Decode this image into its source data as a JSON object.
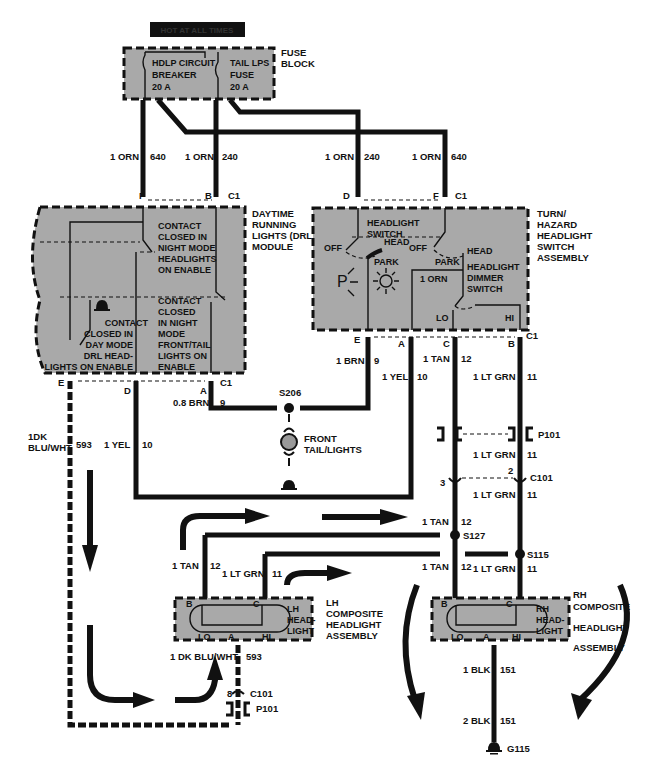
{
  "header_label": "HOT AT ALL TIMES",
  "fuse_block": {
    "title": [
      "FUSE",
      "BLOCK"
    ],
    "circuit_breaker": [
      "HDLP CIRCUIT",
      "BREAKER",
      "20 A"
    ],
    "tail_fuse": [
      "TAIL LPS",
      "FUSE",
      "20 A"
    ]
  },
  "wires_top": [
    {
      "gauge": "1 ORN",
      "circuit": "640"
    },
    {
      "gauge": "1 ORN",
      "circuit": "240"
    },
    {
      "gauge": "1 ORN",
      "circuit": "240"
    },
    {
      "gauge": "1 ORN",
      "circuit": "640"
    }
  ],
  "drl_module": {
    "title": [
      "DAYTIME",
      "RUNNING",
      "LIGHTS (DRL)",
      "MODULE"
    ],
    "contact1": [
      "CONTACT",
      "CLOSED IN",
      "NIGHT MODE",
      "HEADLIGHTS",
      "ON ENABLE"
    ],
    "contact2": [
      "CONTACT",
      "CLOSED",
      "IN NIGHT",
      "MODE",
      "FRONT/TAIL",
      "LIGHTS ON",
      "ENABLE"
    ],
    "contact3": [
      "CONTACT",
      "CLOSED IN",
      "DAY MODE",
      "DRL HEAD-",
      "LIGHTS ON ENABLE"
    ],
    "pins_top": {
      "f": "F",
      "b": "B",
      "conn": "C1"
    },
    "pins_bottom": {
      "e": "E",
      "d": "D",
      "a": "A",
      "conn": "C1"
    }
  },
  "switch_assembly": {
    "title": [
      "TURN/",
      "HAZARD",
      "HEADLIGHT",
      "SWITCH",
      "ASSEMBLY"
    ],
    "headlight_switch": [
      "HEADLIGHT",
      "SWITCH"
    ],
    "off1": "OFF",
    "head1": "HEAD",
    "off2": "OFF",
    "head2": "HEAD",
    "park1": "PARK",
    "park2": "PARK",
    "dimmer": [
      "HEADLIGHT",
      "DIMMER",
      "SWITCH"
    ],
    "internal_wire": "1 ORN",
    "lo": "LO",
    "hi": "HI",
    "pins_top": {
      "d": "D",
      "f": "F",
      "conn": "C1"
    },
    "pins_bottom": {
      "e": "E",
      "a": "A",
      "c": "C",
      "b": "B",
      "conn": "C1"
    }
  },
  "mid_wires": {
    "drl_a": {
      "gauge": "0.8 BRN",
      "circuit": "9"
    },
    "drl_e": {
      "gauge": "1DK BLU/WHT",
      "line1": "1DK",
      "line2": "BLU/WHT",
      "circuit": "593"
    },
    "drl_d": {
      "gauge": "1 YEL",
      "circuit": "10"
    },
    "sw_e": {
      "gauge": "1 BRN",
      "circuit": "9"
    },
    "sw_a": {
      "gauge": "1 YEL",
      "circuit": "10"
    },
    "sw_c": {
      "gauge": "1 TAN",
      "circuit": "12"
    },
    "sw_b": {
      "gauge": "1 LT GRN",
      "circuit": "11"
    },
    "p101_lt_grn": {
      "gauge": "1 LT GRN",
      "circuit": "11"
    },
    "c101_lt_grn": {
      "gauge": "1 LT GRN",
      "circuit": "11"
    },
    "tan_s127_top": {
      "gauge": "1 TAN",
      "circuit": "12"
    },
    "tan_s127_bot": {
      "gauge": "1 TAN",
      "circuit": "12"
    },
    "ltgrn_s115_bot": {
      "gauge": "1 LT GRN",
      "circuit": "11"
    },
    "lh_tan": {
      "gauge": "1 TAN",
      "circuit": "12"
    },
    "lh_ltgrn": {
      "gauge": "1 LT GRN",
      "circuit": "11"
    },
    "lh_ground": {
      "gauge": "1 DK BLU/WHT",
      "circuit": "593"
    },
    "rh_blk1": {
      "gauge": "1 BLK",
      "circuit": "151"
    },
    "rh_blk2": {
      "gauge": "2 BLK",
      "circuit": "151"
    }
  },
  "splices": {
    "s206": "S206",
    "s127": "S127",
    "s115": "S115"
  },
  "connectors": {
    "p101": "P101",
    "c101": "C101",
    "c101_pin3": "3",
    "c101_pin2": "2",
    "c101_pin8": "8"
  },
  "front_tail": [
    "FRONT",
    "TAIL/LIGHTS"
  ],
  "lh_headlight": {
    "title": [
      "LH",
      "COMPOSITE",
      "HEADLIGHT",
      "ASSEMBLY"
    ],
    "inner": [
      "LH",
      "HEAD-",
      "LIGHT"
    ],
    "b": "B",
    "c": "C",
    "lo": "LO",
    "a": "A",
    "hi": "HI"
  },
  "rh_headlight": {
    "title": [
      "RH",
      "COMPOSITE",
      "HEADLIGHT",
      "ASSEMBLY"
    ],
    "inner": [
      "RH",
      "HEAD-",
      "LIGHT"
    ],
    "b": "B",
    "c": "C",
    "lo": "LO",
    "a": "A",
    "hi": "HI"
  },
  "ground": "G115"
}
